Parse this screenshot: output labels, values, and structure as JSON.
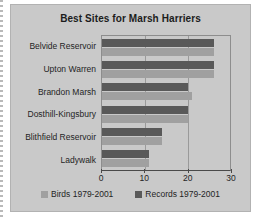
{
  "chart_data": {
    "type": "bar",
    "orientation": "horizontal",
    "title": "Best Sites for Marsh Harriers",
    "xlabel": "",
    "ylabel": "",
    "xlim": [
      0,
      30
    ],
    "xticks": [
      0,
      10,
      20,
      30
    ],
    "xtick_labels": [
      "0",
      "10",
      "20",
      "30"
    ],
    "grid": true,
    "legend_position": "bottom",
    "categories": [
      "Belvide Reservoir",
      "Upton Warren",
      "Brandon Marsh",
      "Dosthill-Kingsbury",
      "Blithfield Reservoir",
      "Ladywalk"
    ],
    "series": [
      {
        "name": "Records 1979-2001",
        "color": "#595959",
        "values": [
          26,
          26,
          20,
          20,
          14,
          11
        ]
      },
      {
        "name": "Birds 1979-2001",
        "color": "#a0a0a0",
        "values": [
          26,
          26,
          21,
          20,
          14,
          11
        ]
      }
    ]
  },
  "legend": {
    "items": [
      {
        "label": "Birds 1979-2001",
        "color": "#a0a0a0"
      },
      {
        "label": "Records 1979-2001",
        "color": "#595959"
      }
    ]
  },
  "colors": {
    "chart_background": "#c9c9c9",
    "page_background": "#ffffff",
    "axis": "#4a4a4a",
    "gridline": "#9a9a9a",
    "text": "#1f1f1f"
  }
}
